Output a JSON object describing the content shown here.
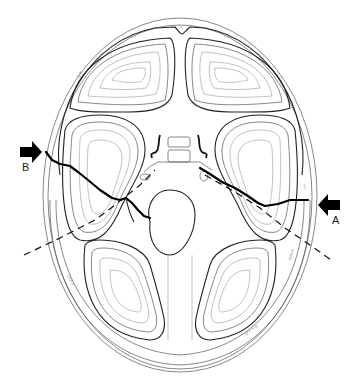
{
  "figure": {
    "type": "anatomical line drawing",
    "background": "#ffffff",
    "line_color": "#000000"
  },
  "labels": {
    "arrow_a": "A",
    "arrow_b": "B"
  },
  "arrows": [
    {
      "id": "A",
      "direction": "left",
      "position": "right side, mid-height"
    },
    {
      "id": "B",
      "direction": "right",
      "position": "left side, upper-middle"
    }
  ],
  "lines": {
    "fracture": {
      "style": "solid",
      "weight": "bold",
      "from": "B",
      "to": "A"
    },
    "axis": {
      "style": "dashed",
      "from": "lower-left",
      "to": "lower-right",
      "through": "skull base center"
    }
  },
  "icons": {
    "arrow_a": "arrow-left-icon",
    "arrow_b": "arrow-right-icon"
  }
}
